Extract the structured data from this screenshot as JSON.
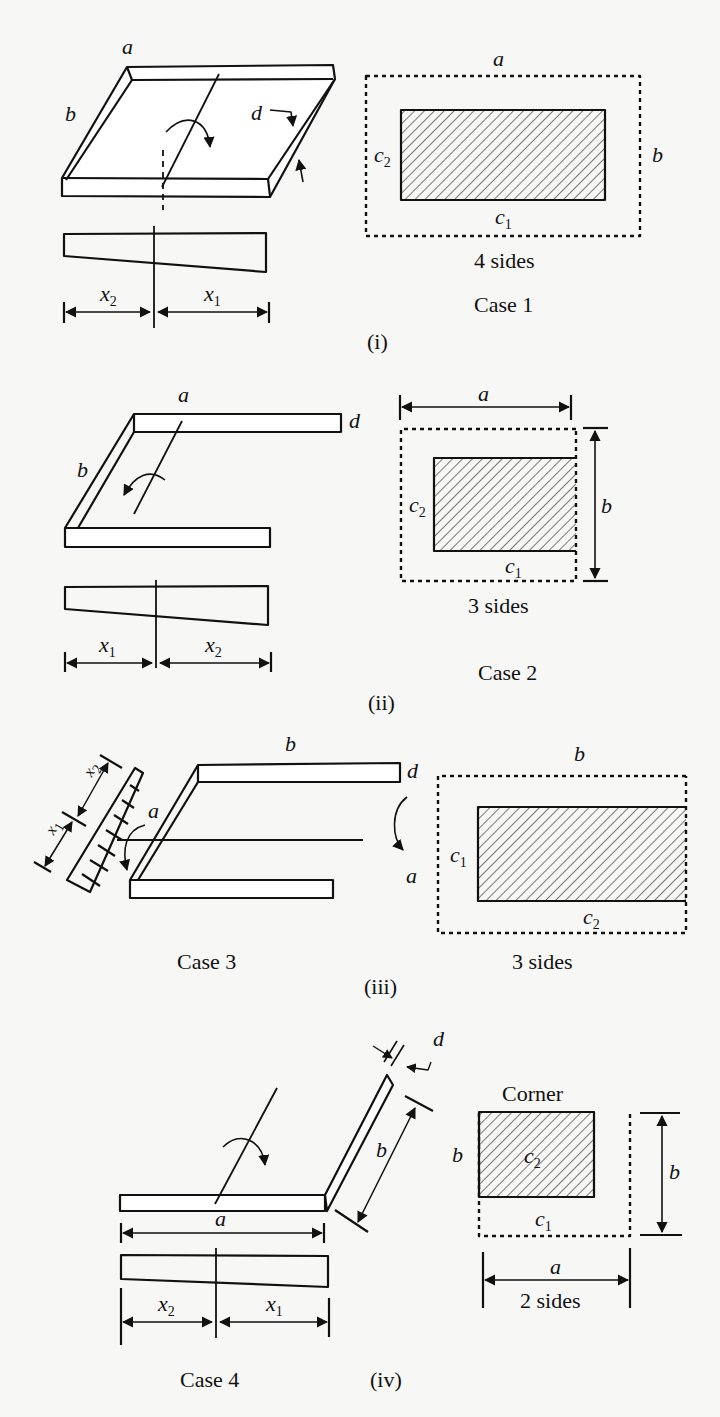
{
  "figure": {
    "panels": [
      {
        "id": "i",
        "roman": "(i)",
        "case_label": "Case  1",
        "sides_label": "4  sides",
        "iso_labels": {
          "a": "a",
          "b": "b",
          "d": "d"
        },
        "dist_labels": {
          "left": "x",
          "left_sub": "2",
          "right": "x",
          "right_sub": "1"
        },
        "plan_labels": {
          "top": "a",
          "right": "b",
          "left": "c",
          "left_sub": "2",
          "bottom": "c",
          "bottom_sub": "1"
        }
      },
      {
        "id": "ii",
        "roman": "(ii)",
        "case_label": "Case  2",
        "sides_label": "3  sides",
        "iso_labels": {
          "a": "a",
          "b": "b",
          "d": "d"
        },
        "dist_labels": {
          "left": "x",
          "left_sub": "1",
          "right": "x",
          "right_sub": "2"
        },
        "plan_labels": {
          "top": "a",
          "right": "b",
          "left": "c",
          "left_sub": "2",
          "bottom": "c",
          "bottom_sub": "1"
        }
      },
      {
        "id": "iii",
        "roman": "(iii)",
        "case_label": "Case  3",
        "sides_label": "3  sides",
        "iso_labels": {
          "a": "a",
          "b": "b",
          "d": "d",
          "a2": "a"
        },
        "dist_labels": {
          "upper": "x",
          "upper_sub": "2",
          "lower": "x",
          "lower_sub": "1"
        },
        "plan_labels": {
          "top": "b",
          "left": "c",
          "left_sub": "1",
          "bottom": "c",
          "bottom_sub": "2"
        }
      },
      {
        "id": "iv",
        "roman": "(iv)",
        "case_label": "Case  4",
        "sides_label": "2  sides",
        "corner_label": "Corner",
        "iso_labels": {
          "a": "a",
          "b": "b",
          "d": "d"
        },
        "dist_labels": {
          "left": "x",
          "left_sub": "2",
          "right": "x",
          "right_sub": "1"
        },
        "plan_labels": {
          "left": "b",
          "right": "b",
          "inner": "c",
          "inner_sub": "2",
          "bottom": "c",
          "bottom_sub": "1",
          "dim": "a"
        }
      }
    ]
  }
}
